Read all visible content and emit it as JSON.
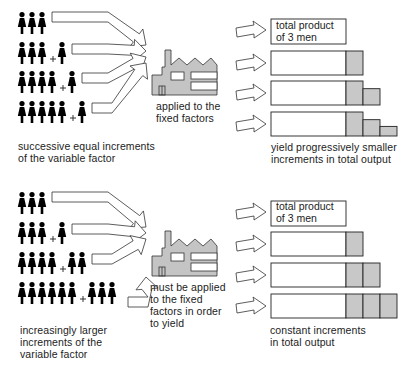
{
  "colors": {
    "figure": "#000000",
    "factory_fill": "#c4c4c4",
    "factory_stroke": "#333333",
    "shade": "#c8c8c8",
    "outline": "#222222"
  },
  "panels": [
    {
      "id": "diminishing",
      "rows": [
        {
          "base": 3,
          "extra": 0
        },
        {
          "base": 3,
          "extra": 1
        },
        {
          "base": 4,
          "extra": 1
        },
        {
          "base": 5,
          "extra": 1
        }
      ],
      "bars": [
        0,
        1,
        2,
        3
      ],
      "increments": [
        1.0,
        1.0,
        0.6
      ],
      "left_caption": [
        "successive equal increments",
        "of the variable factor"
      ],
      "factory_caption": [
        "applied to the",
        "fixed factors"
      ],
      "box_label": [
        "total product",
        "of 3 men"
      ],
      "right_caption": [
        "yield progressively smaller",
        "increments in total output"
      ]
    },
    {
      "id": "increasing",
      "rows": [
        {
          "base": 3,
          "extra": 0
        },
        {
          "base": 3,
          "extra": 1
        },
        {
          "base": 4,
          "extra": 2
        },
        {
          "base": 6,
          "extra": 3
        }
      ],
      "bars": [
        0,
        1,
        2,
        3
      ],
      "increments": [
        1.0,
        1.0,
        1.0
      ],
      "left_caption": [
        "increasingly larger",
        "increments of the",
        "variable factor"
      ],
      "factory_caption": [
        "must be applied",
        "to the fixed",
        "factors in order",
        "to yield"
      ],
      "box_label": [
        "total product",
        "of 3 men"
      ],
      "right_caption": [
        "constant increments",
        "in total output"
      ]
    }
  ],
  "chart_data": {
    "type": "diagram",
    "title": "",
    "panels": [
      {
        "inputs_workers": [
          3,
          4,
          5,
          6
        ],
        "output_increment_widths": [
          0,
          1.0,
          1.0,
          0.6
        ],
        "note": "equal labour increments yield diminishing output increments"
      },
      {
        "inputs_workers": [
          3,
          4,
          6,
          9
        ],
        "output_increment_widths": [
          0,
          1.0,
          1.0,
          1.0
        ],
        "note": "increasing labour increments needed for constant output increments"
      }
    ]
  }
}
